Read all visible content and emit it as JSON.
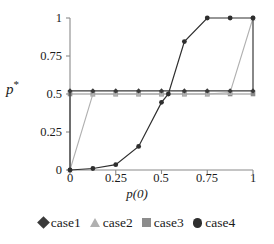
{
  "chart_data": {
    "type": "line",
    "title": "",
    "xlabel": "p(0)",
    "ylabel": "p*",
    "xlim": [
      0,
      1
    ],
    "ylim": [
      0,
      1
    ],
    "xticks": [
      "0",
      "0.25",
      "0.5",
      "0.75",
      "1"
    ],
    "xtick_values": [
      0,
      0.25,
      0.5,
      0.75,
      1
    ],
    "yticks": [
      "0",
      "0.25",
      "0.5",
      "0.75",
      "1"
    ],
    "ytick_values": [
      0,
      0.25,
      0.5,
      0.75,
      1
    ],
    "grid": false,
    "legend_position": "bottom",
    "x": [
      0,
      0,
      0.125,
      0.25,
      0.375,
      0.5,
      0.625,
      0.75,
      0.875,
      1,
      1
    ],
    "series": [
      {
        "name": "case1",
        "marker": "diamond",
        "color": "#3a3a3a",
        "x": [
          0,
          0,
          0.125,
          0.25,
          0.375,
          0.5,
          0.625,
          0.75,
          0.875,
          1,
          1
        ],
        "values": [
          0,
          0.52,
          0.52,
          0.52,
          0.52,
          0.52,
          0.52,
          0.52,
          0.52,
          0.52,
          1
        ]
      },
      {
        "name": "case2",
        "marker": "triangle",
        "color": "#b0b0b0",
        "x": [
          0,
          0.125,
          0.25,
          0.375,
          0.5,
          0.625,
          0.75,
          0.875,
          1
        ],
        "values": [
          0,
          0.5,
          0.5,
          0.5,
          0.5,
          0.5,
          0.5,
          0.51,
          1
        ]
      },
      {
        "name": "case3",
        "marker": "square",
        "color": "#8c8c8c",
        "x": [
          0,
          0.125,
          0.25,
          0.375,
          0.5,
          0.625,
          0.75,
          0.875,
          1
        ],
        "values": [
          0.5,
          0.5,
          0.5,
          0.5,
          0.5,
          0.5,
          0.5,
          0.5,
          0.5
        ]
      },
      {
        "name": "case4",
        "marker": "circle",
        "color": "#2e2e2e",
        "x": [
          0,
          0.125,
          0.25,
          0.375,
          0.5,
          0.5375,
          0.625,
          0.75,
          0.875,
          1
        ],
        "values": [
          0,
          0.01,
          0.035,
          0.155,
          0.445,
          0.5,
          0.845,
          1.0,
          1.0,
          1.0
        ]
      }
    ]
  },
  "legend": {
    "items": [
      {
        "label": "case1",
        "marker": "diamond-marker",
        "color": "#3a3a3a"
      },
      {
        "label": "case2",
        "marker": "triangle-marker",
        "color": "#b0b0b0"
      },
      {
        "label": "case3",
        "marker": "square-marker",
        "color": "#8c8c8c"
      },
      {
        "label": "case4",
        "marker": "circle-marker",
        "color": "#2e2e2e"
      }
    ]
  },
  "axes": {
    "y_label_text": "p",
    "y_label_sup": "*",
    "x_label_text": "p(0)"
  }
}
